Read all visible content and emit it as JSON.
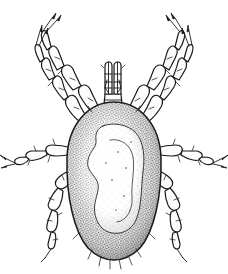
{
  "figure": {
    "kind": "scientific-line-drawing",
    "subject_label": "mite",
    "view_label": "dorsal view",
    "technique_label": "stipple and line ink drawing",
    "caption": "",
    "title": "",
    "background_color": "#ffffff",
    "ink_color": "#1a1a1a",
    "body_shade_color": "#9b9b9b",
    "body_highlight_color": "#f4f2ee",
    "canvas": {
      "width": 228,
      "height": 274
    }
  },
  "anatomy": {
    "idiosoma": {
      "label": "idiosoma",
      "shape": "oval",
      "bounds": {
        "x": 68,
        "y": 102,
        "width": 94,
        "height": 158
      },
      "texture": "stipple"
    },
    "dorsal_pattern": {
      "label": "dorsal shield pattern",
      "description": "irregular pale wavy region on central idiosoma"
    },
    "gnathosoma": {
      "label": "gnathosoma",
      "parts": [
        "chelicera-left",
        "chelicera-right",
        "palp-left",
        "palp-right",
        "hypostome"
      ],
      "bounds": {
        "x": 100,
        "y": 62,
        "width": 26,
        "height": 44
      }
    },
    "legs": [
      {
        "id": "leg-1-left",
        "label": "leg I left",
        "side": "left",
        "pair": 1,
        "segments": 6,
        "tip": "claw"
      },
      {
        "id": "leg-1-right",
        "label": "leg I right",
        "side": "right",
        "pair": 1,
        "segments": 6,
        "tip": "claw"
      },
      {
        "id": "leg-2-left",
        "label": "leg II left",
        "side": "left",
        "pair": 2,
        "segments": 6,
        "tip": "claw"
      },
      {
        "id": "leg-2-right",
        "label": "leg II right",
        "side": "right",
        "pair": 2,
        "segments": 6,
        "tip": "claw"
      },
      {
        "id": "leg-3-left",
        "label": "leg III left",
        "side": "left",
        "pair": 3,
        "segments": 5,
        "tip": "claw"
      },
      {
        "id": "leg-3-right",
        "label": "leg III right",
        "side": "right",
        "pair": 3,
        "segments": 5,
        "tip": "claw"
      },
      {
        "id": "leg-4-left",
        "label": "leg IV left",
        "side": "left",
        "pair": 4,
        "segments": 5,
        "tip": "claw"
      },
      {
        "id": "leg-4-right",
        "label": "leg IV right",
        "side": "right",
        "pair": 4,
        "segments": 5,
        "tip": "claw"
      }
    ],
    "setae": {
      "label": "setae",
      "description": "fine bristles on leg segments and posterior body margin",
      "posterior_count": 7
    }
  }
}
